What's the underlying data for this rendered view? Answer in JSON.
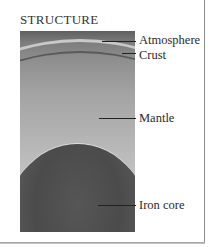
{
  "figure": {
    "title": "STRUCTURE",
    "layers": [
      {
        "id": "atmosphere",
        "label": "Atmosphere"
      },
      {
        "id": "crust",
        "label": "Crust"
      },
      {
        "id": "mantle",
        "label": "Mantle"
      },
      {
        "id": "iron-core",
        "label": "Iron core"
      }
    ]
  }
}
